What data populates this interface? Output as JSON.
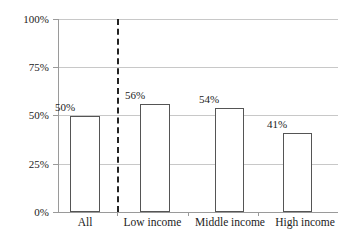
{
  "chart_data": {
    "type": "bar",
    "title": "",
    "subtitle": "",
    "xlabel": "",
    "ylabel": "",
    "categories": [
      "All",
      "Low  income",
      "Middle income",
      "High income"
    ],
    "values": [
      50,
      56,
      54,
      41
    ],
    "value_labels": [
      "50%",
      "56%",
      "54%",
      "41%"
    ],
    "ylim": [
      0,
      100
    ],
    "ytick_values": [
      0,
      25,
      50,
      75,
      100
    ],
    "ytick_labels": [
      "0%",
      "25%",
      "50%",
      "75%",
      "100%"
    ],
    "grid": true,
    "grid_axis": "y",
    "legend": false,
    "annotations": [
      {
        "type": "vertical-dashed-line",
        "between": [
          "All",
          "Low  income"
        ],
        "style": "dashed",
        "color": "#222222"
      }
    ],
    "colors": {
      "bar_fill": "#ffffff",
      "bar_edge": "#555555",
      "gridline": "#c8c8c8",
      "axis": "#9a9a9a",
      "text": "#222222",
      "divider": "#222222"
    }
  },
  "axis": {
    "y_labels": [
      {
        "text": "100%"
      },
      {
        "text": "75%"
      },
      {
        "text": "50%"
      },
      {
        "text": "25%"
      },
      {
        "text": "0%"
      }
    ],
    "x_labels": [
      {
        "text": "All"
      },
      {
        "text": "Low  income"
      },
      {
        "text": "Middle income"
      },
      {
        "text": "High income"
      }
    ]
  },
  "bars": [
    {
      "label": "All",
      "value_label": "50%"
    },
    {
      "label": "Low  income",
      "value_label": "56%"
    },
    {
      "label": "Middle income",
      "value_label": "54%"
    },
    {
      "label": "High income",
      "value_label": "41%"
    }
  ]
}
